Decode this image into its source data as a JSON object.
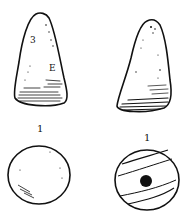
{
  "figure": {
    "objects": [
      {
        "id": "left",
        "side_view": {
          "marks": [
            "3",
            "E"
          ]
        },
        "scale_mark": "1",
        "top_view": {
          "type": "plain-circle"
        }
      },
      {
        "id": "right",
        "side_view": {
          "marks": []
        },
        "scale_mark": "1",
        "top_view": {
          "type": "circle-with-central-hole-and-bands"
        }
      }
    ],
    "colors": {
      "ink": "#111111",
      "background": "#ffffff"
    }
  }
}
